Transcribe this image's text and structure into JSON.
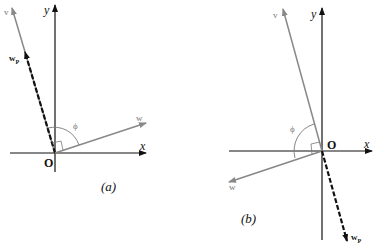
{
  "figures": [
    {
      "id": "a",
      "caption": "(a)",
      "labels": {
        "y_axis": "y",
        "x_axis": "x",
        "origin": "O",
        "v": "v",
        "w": "w",
        "wp": "w",
        "wp_sub": "P",
        "angle": "ϕ"
      }
    },
    {
      "id": "b",
      "caption": "(b)",
      "labels": {
        "y_axis": "y",
        "x_axis": "x",
        "origin": "O",
        "v": "v",
        "w": "w",
        "wp": "w",
        "wp_sub": "P",
        "angle": "ϕ"
      }
    }
  ],
  "colors": {
    "axis": "#111111",
    "vector_gray": "#888888",
    "projection": "#111111"
  }
}
